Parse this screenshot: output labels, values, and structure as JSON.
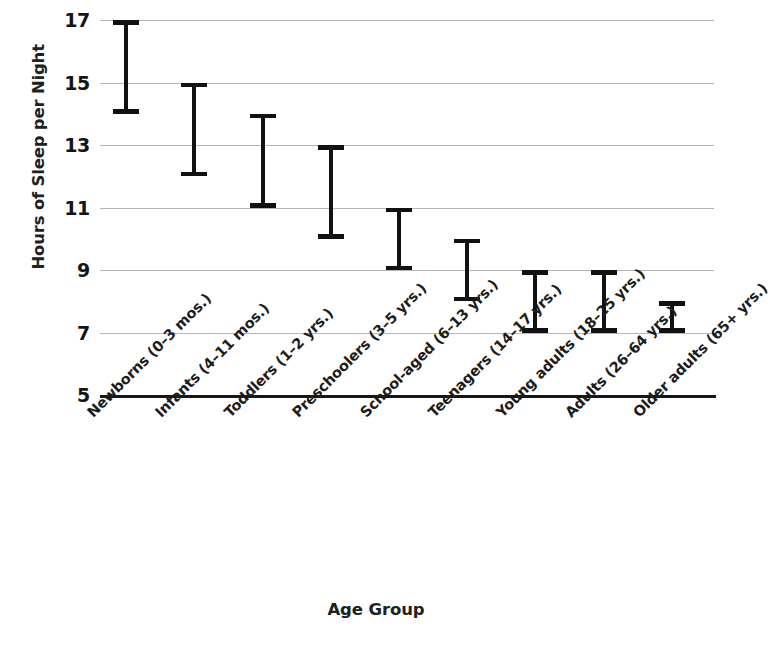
{
  "chart_data": {
    "type": "bar",
    "subtype": "range-bars",
    "title": "",
    "xlabel": "Age Group",
    "ylabel": "Hours of Sleep per Night",
    "ylim": [
      5,
      17
    ],
    "yticks": [
      17,
      15,
      13,
      11,
      9,
      7,
      5
    ],
    "grid": true,
    "legend": null,
    "categories": [
      "Newborns (0–3 mos.)",
      "Infants (4–11 mos.)",
      "Toddlers (1–2 yrs.)",
      "Preschoolers (3–5 yrs.)",
      "School-aged (6–13 yrs.)",
      "Teenagers (14–17 yrs.)",
      "Young adults (18–25 yrs.)",
      "Adults (26–64 yrs.)",
      "Older adults (65+ yrs.)"
    ],
    "series": [
      {
        "name": "low",
        "values": [
          14,
          12,
          11,
          10,
          9,
          8,
          7,
          7,
          7
        ]
      },
      {
        "name": "high",
        "values": [
          17,
          15,
          14,
          13,
          11,
          10,
          9,
          9,
          8
        ]
      }
    ],
    "ranges": [
      {
        "category": "Newborns (0–3 mos.)",
        "low": 14,
        "high": 17
      },
      {
        "category": "Infants (4–11 mos.)",
        "low": 12,
        "high": 15
      },
      {
        "category": "Toddlers (1–2 yrs.)",
        "low": 11,
        "high": 14
      },
      {
        "category": "Preschoolers (3–5 yrs.)",
        "low": 10,
        "high": 13
      },
      {
        "category": "School-aged (6–13 yrs.)",
        "low": 9,
        "high": 11
      },
      {
        "category": "Teenagers (14–17 yrs.)",
        "low": 8,
        "high": 10
      },
      {
        "category": "Young adults (18–25 yrs.)",
        "low": 7,
        "high": 9
      },
      {
        "category": "Adults (26–64 yrs.)",
        "low": 7,
        "high": 9
      },
      {
        "category": "Older adults (65+ yrs.)",
        "low": 7,
        "high": 8
      }
    ],
    "colors": {
      "bar": "#111111",
      "gridline": "#9a9a9a",
      "axis": "#161616",
      "text": "#1a1a1a",
      "background": "#ffffff"
    }
  }
}
